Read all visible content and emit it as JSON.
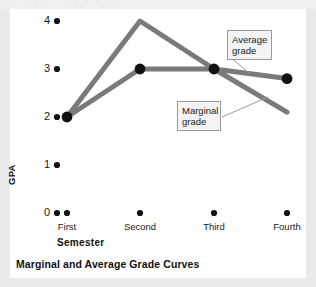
{
  "caption": "Marginal and Average Grade Curves",
  "colors": {
    "line": "#7a7a7a",
    "marker": "#111111",
    "callout_bg": "#f4f4f4",
    "callout_border": "#9a9a9a",
    "card_bg": "#ffffff",
    "page_bg": "#eaeaea"
  },
  "callouts": {
    "average": "Average grade",
    "marginal": "Marginal grade"
  },
  "axes": {
    "ylabel": "GPA",
    "xlabel": "Semester",
    "yticks": [
      "4",
      "3",
      "2",
      "1",
      "0"
    ],
    "xticks": [
      "First",
      "Second",
      "Third",
      "Fourth"
    ]
  },
  "chart_data": {
    "type": "line",
    "title": "Marginal and Average Grade Curves",
    "xlabel": "Semester",
    "ylabel": "GPA",
    "categories": [
      "First",
      "Second",
      "Third",
      "Fourth"
    ],
    "ylim": [
      0,
      4
    ],
    "yticks": [
      0,
      1,
      2,
      3,
      4
    ],
    "grid": false,
    "legend": "callout-annotations",
    "series": [
      {
        "name": "Marginal grade",
        "values": [
          2.0,
          4.0,
          3.0,
          2.1
        ],
        "markers": [
          true,
          false,
          true,
          false
        ]
      },
      {
        "name": "Average grade",
        "values": [
          2.0,
          3.0,
          3.0,
          2.8
        ],
        "markers": [
          true,
          true,
          true,
          true
        ]
      }
    ],
    "annotations": [
      {
        "text": "Average grade",
        "points_to": "average-grade-curve"
      },
      {
        "text": "Marginal grade",
        "points_to": "marginal-grade-curve"
      }
    ]
  }
}
